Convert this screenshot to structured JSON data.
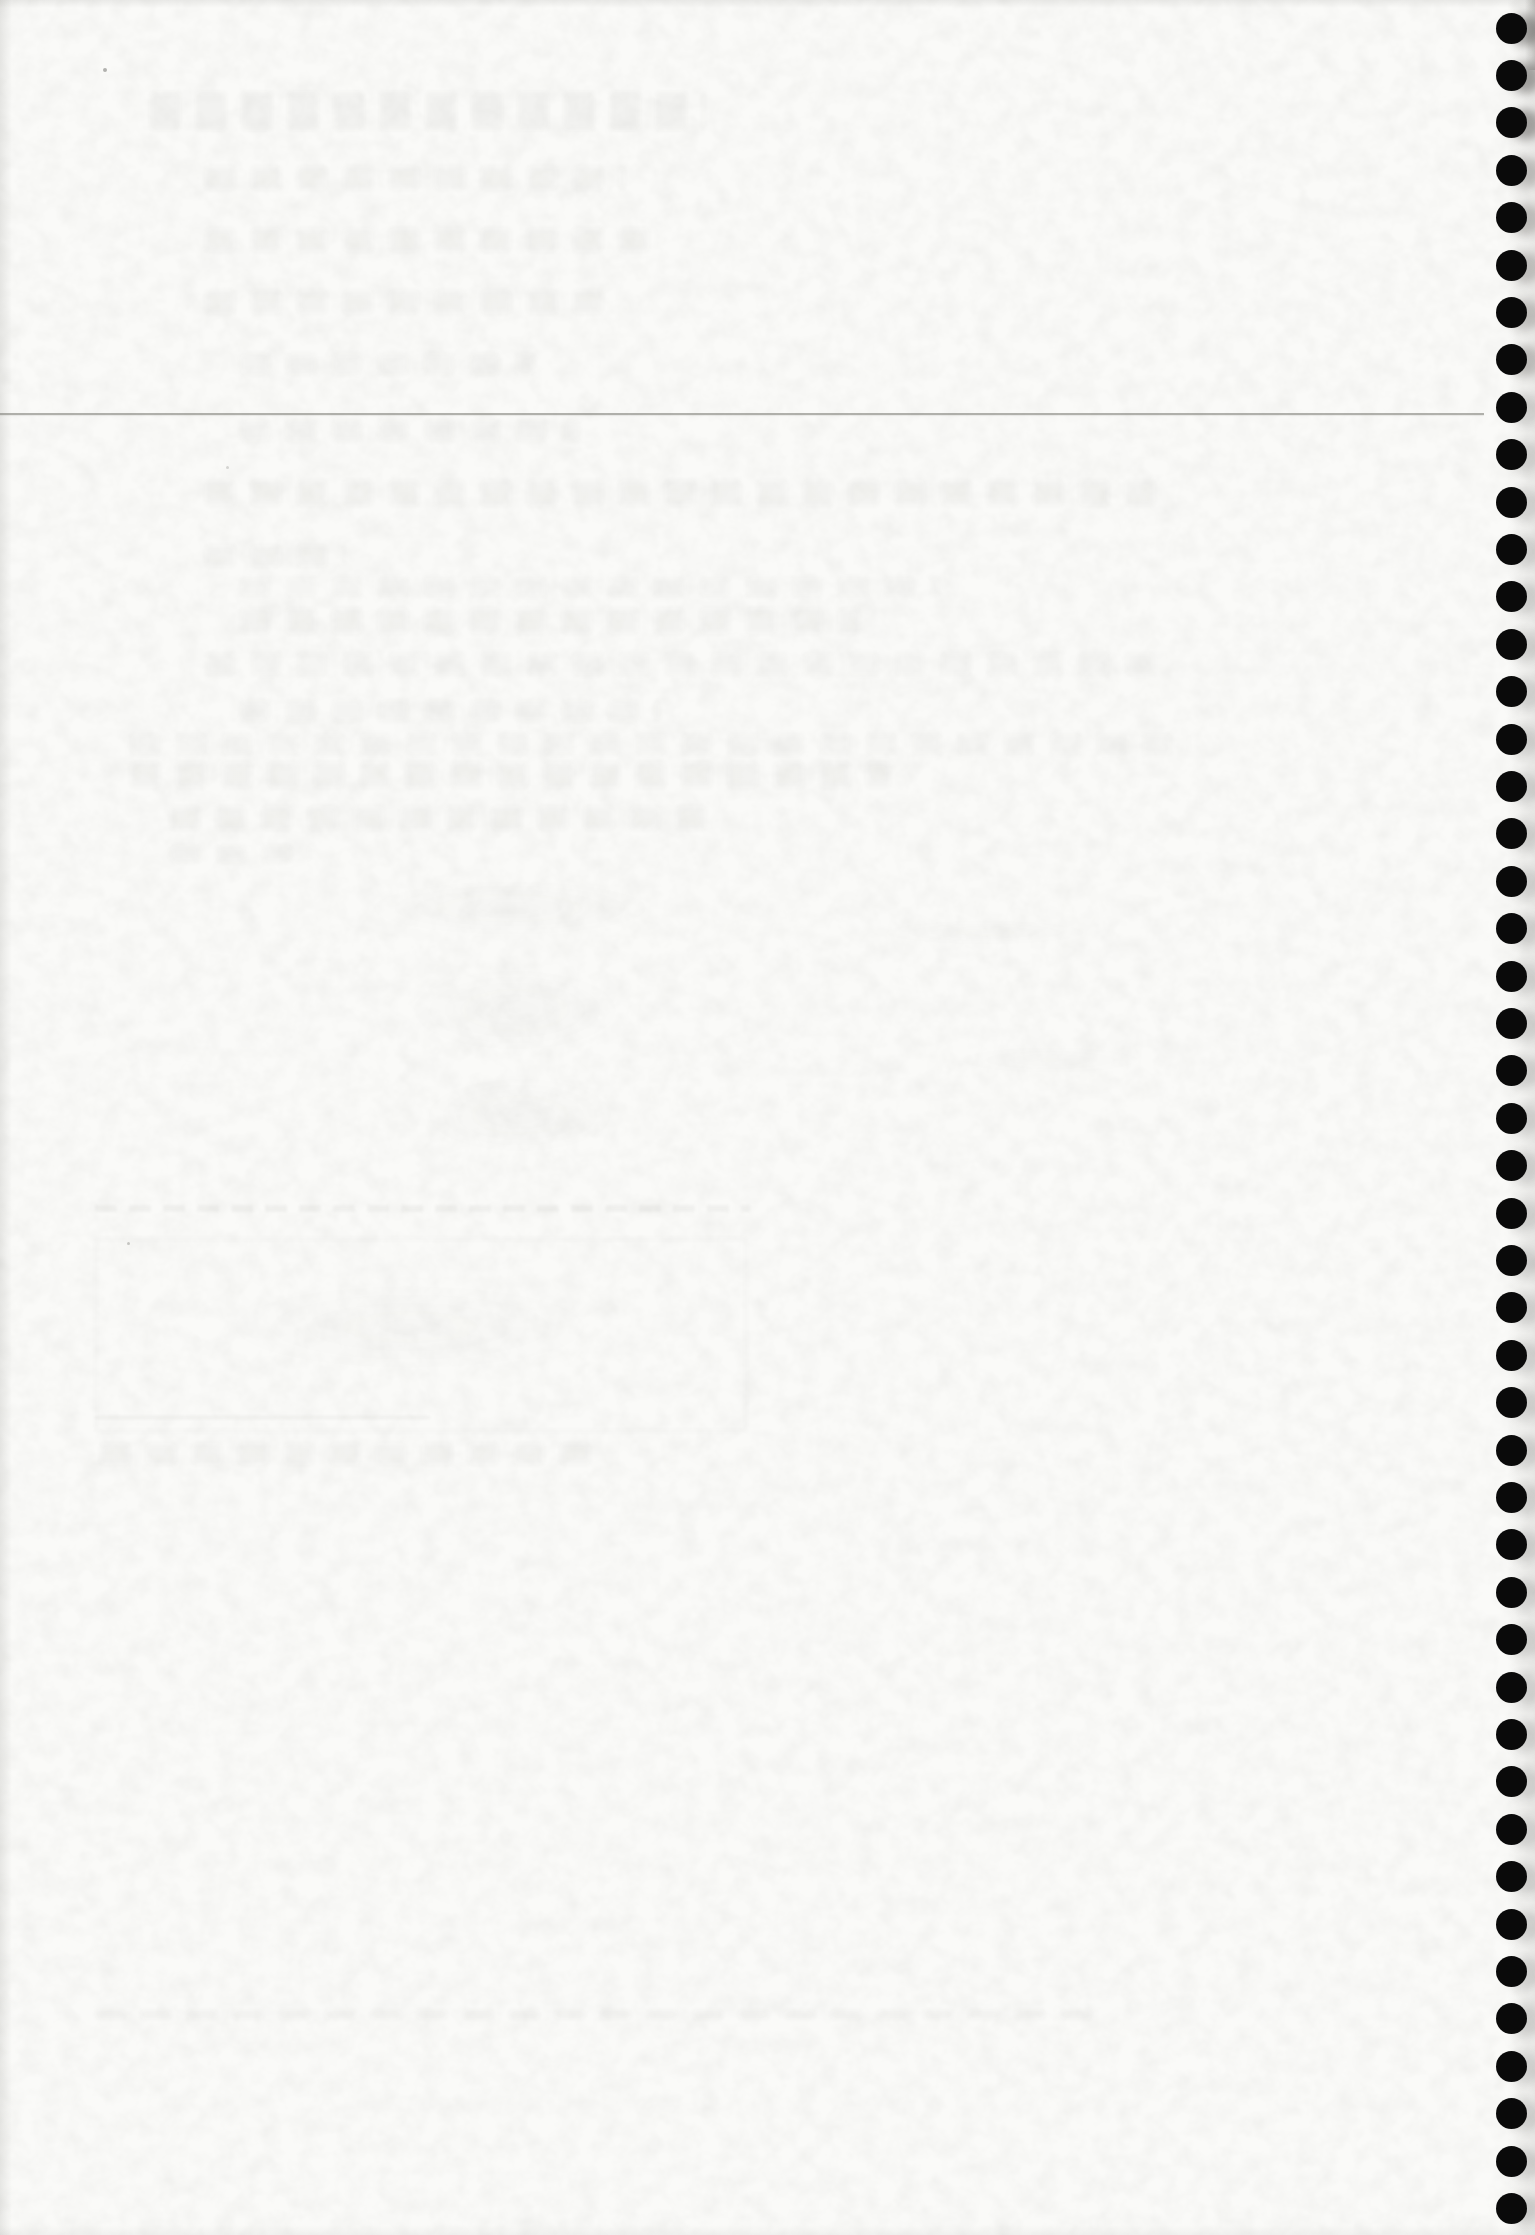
{
  "page": {
    "kind": "scanned notebook page, blank side with spiral-binding holes",
    "visible_text": "",
    "background_color": "#fafaf8"
  },
  "binding": {
    "holes_count": 47,
    "hole_color": "#0a0a0a",
    "hole_diameter_px": 31,
    "column_center_x_px": 1511,
    "first_hole_center_y_px": 28,
    "hole_spacing_y_px": 47.4
  },
  "pencil_rule": {
    "y_px": 413,
    "x_start_px": 0,
    "x_end_px": 1484
  },
  "bleed_through_marks": [
    {
      "kind": "band",
      "x": 150,
      "y": 92,
      "w": 555,
      "h": 38,
      "opacity": 0.045
    },
    {
      "kind": "band",
      "x": 205,
      "y": 166,
      "w": 420,
      "h": 24,
      "opacity": 0.03
    },
    {
      "kind": "band",
      "x": 205,
      "y": 228,
      "w": 455,
      "h": 24,
      "opacity": 0.03
    },
    {
      "kind": "band",
      "x": 205,
      "y": 290,
      "w": 410,
      "h": 24,
      "opacity": 0.03
    },
    {
      "kind": "band",
      "x": 240,
      "y": 353,
      "w": 295,
      "h": 22,
      "opacity": 0.028
    },
    {
      "kind": "band",
      "x": 240,
      "y": 420,
      "w": 340,
      "h": 22,
      "opacity": 0.028
    },
    {
      "kind": "band",
      "x": 205,
      "y": 480,
      "w": 950,
      "h": 26,
      "opacity": 0.03
    },
    {
      "kind": "band",
      "x": 205,
      "y": 545,
      "w": 140,
      "h": 22,
      "opacity": 0.03
    },
    {
      "kind": "band",
      "x": 240,
      "y": 577,
      "w": 700,
      "h": 20,
      "opacity": 0.022
    },
    {
      "kind": "band",
      "x": 240,
      "y": 608,
      "w": 620,
      "h": 26,
      "opacity": 0.03
    },
    {
      "kind": "band",
      "x": 205,
      "y": 652,
      "w": 960,
      "h": 24,
      "opacity": 0.025
    },
    {
      "kind": "band",
      "x": 240,
      "y": 700,
      "w": 420,
      "h": 22,
      "opacity": 0.028
    },
    {
      "kind": "band",
      "x": 130,
      "y": 733,
      "w": 1060,
      "h": 22,
      "opacity": 0.022
    },
    {
      "kind": "band",
      "x": 130,
      "y": 762,
      "w": 760,
      "h": 26,
      "opacity": 0.03
    },
    {
      "kind": "band",
      "x": 170,
      "y": 806,
      "w": 540,
      "h": 24,
      "opacity": 0.03
    },
    {
      "kind": "band",
      "x": 170,
      "y": 845,
      "w": 140,
      "h": 18,
      "opacity": 0.028
    },
    {
      "kind": "blob",
      "x": 300,
      "y": 868,
      "w": 420,
      "h": 80,
      "opacity": 0.03
    },
    {
      "kind": "blob",
      "x": 820,
      "y": 915,
      "w": 330,
      "h": 35,
      "opacity": 0.022
    },
    {
      "kind": "blob",
      "x": 360,
      "y": 950,
      "w": 310,
      "h": 120,
      "opacity": 0.032
    },
    {
      "kind": "blob",
      "x": 380,
      "y": 1060,
      "w": 280,
      "h": 110,
      "opacity": 0.03
    },
    {
      "kind": "blob",
      "x": 900,
      "y": 1040,
      "w": 300,
      "h": 40,
      "opacity": 0.02
    },
    {
      "kind": "dash",
      "x": 95,
      "y": 1205,
      "w": 655,
      "h": 7,
      "opacity": 0.05
    },
    {
      "kind": "box",
      "x": 95,
      "y": 1238,
      "w": 648,
      "h": 190,
      "opacity": 0.045
    },
    {
      "kind": "blob",
      "x": 130,
      "y": 1262,
      "w": 560,
      "h": 130,
      "opacity": 0.022
    },
    {
      "kind": "line",
      "x": 95,
      "y": 1416,
      "w": 335,
      "h": 3,
      "opacity": 0.06
    },
    {
      "kind": "band",
      "x": 100,
      "y": 1443,
      "w": 500,
      "h": 22,
      "opacity": 0.03
    },
    {
      "kind": "band",
      "x": 95,
      "y": 2010,
      "w": 1005,
      "h": 9,
      "opacity": 0.04
    }
  ],
  "specks": [
    {
      "x": 103,
      "y": 68,
      "size": 4,
      "opacity": 0.5
    },
    {
      "x": 226,
      "y": 466,
      "size": 3,
      "opacity": 0.25
    },
    {
      "x": 127,
      "y": 1242,
      "size": 3,
      "opacity": 0.35
    }
  ]
}
